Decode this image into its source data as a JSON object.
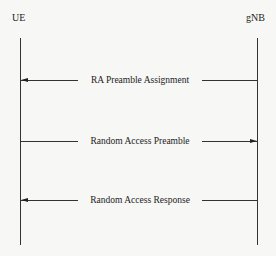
{
  "diagram": {
    "type": "sequence",
    "participants": [
      {
        "id": "ue",
        "label": "UE"
      },
      {
        "id": "gnb",
        "label": "gNB"
      }
    ],
    "messages": [
      {
        "label": "RA Preamble Assignment",
        "from": "gNB",
        "to": "UE"
      },
      {
        "label": "Random Access Preamble",
        "from": "UE",
        "to": "gNB"
      },
      {
        "label": "Random Access Response",
        "from": "gNB",
        "to": "UE"
      }
    ]
  }
}
